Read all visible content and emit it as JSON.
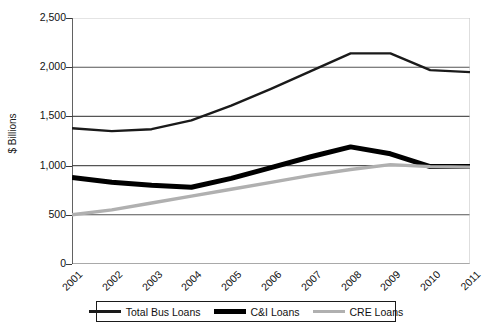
{
  "chart_data": {
    "type": "line",
    "title": "",
    "xlabel": "",
    "ylabel": "$ Billions",
    "categories": [
      "2001",
      "2002",
      "2003",
      "2004",
      "2005",
      "2006",
      "2007",
      "2008",
      "2009",
      "2010",
      "2011"
    ],
    "ylim": [
      0,
      2500
    ],
    "y_ticks": [
      0,
      500,
      1000,
      1500,
      2000,
      2500
    ],
    "y_tick_labels": [
      "0",
      "500",
      "1,000",
      "1,500",
      "2,000",
      "2,500"
    ],
    "grid": true,
    "legend_position": "bottom",
    "series": [
      {
        "name": "Total Bus Loans",
        "color": "#1a1a1a",
        "width": 2.4,
        "values": [
          1380,
          1350,
          1370,
          1460,
          1610,
          1780,
          1960,
          2140,
          2140,
          1970,
          1950
        ]
      },
      {
        "name": "C&I Loans",
        "color": "#000000",
        "width": 5.0,
        "values": [
          880,
          830,
          800,
          780,
          870,
          980,
          1090,
          1190,
          1120,
          990,
          990
        ]
      },
      {
        "name": "CRE Loans",
        "color": "#b0b0b0",
        "width": 3.4,
        "values": [
          500,
          550,
          620,
          690,
          760,
          830,
          900,
          960,
          1010,
          990,
          985
        ]
      }
    ]
  },
  "axis": {
    "y_title": "$ Billions"
  },
  "legend": {
    "items": [
      {
        "label": "Total Bus Loans",
        "style": "total"
      },
      {
        "label": "C&I Loans",
        "style": "ci"
      },
      {
        "label": "CRE Loans",
        "style": "cre"
      }
    ]
  }
}
